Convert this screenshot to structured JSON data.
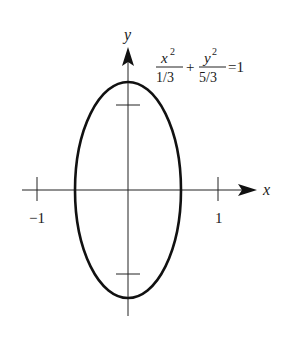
{
  "diagram": {
    "equation": {
      "term1_numerator": "x",
      "term1_exponent": "2",
      "term1_denominator": "1/3",
      "plus": "+",
      "term2_numerator": "y",
      "term2_exponent": "2",
      "term2_denominator": "5/3",
      "equals": "=1"
    },
    "axes": {
      "x_label": "x",
      "y_label": "y",
      "x_tick_labels": [
        "−1",
        "1"
      ]
    },
    "ellipse": {
      "a_squared": "1/3",
      "b_squared": "5/3"
    },
    "colors": {
      "stroke": "#111111",
      "background": "#ffffff"
    }
  }
}
